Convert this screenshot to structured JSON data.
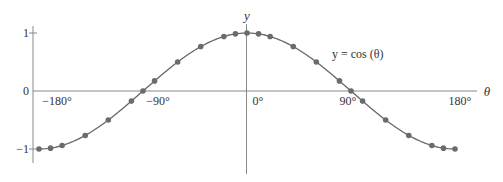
{
  "chart_data": {
    "type": "line",
    "title": "",
    "function_label": "y = cos (θ)",
    "xlabel": "θ",
    "ylabel": "y",
    "xlim": [
      -180,
      180
    ],
    "ylim": [
      -1,
      1
    ],
    "grid": false,
    "legend": null,
    "x_ticks": [
      {
        "value": -180,
        "label": "−180°"
      },
      {
        "value": -90,
        "label": "−90°"
      },
      {
        "value": 0,
        "label": "0°"
      },
      {
        "value": 90,
        "label": "90°"
      },
      {
        "value": 180,
        "label": "180°"
      }
    ],
    "y_ticks": [
      {
        "value": 1,
        "label": "1"
      },
      {
        "value": 0,
        "label": "0"
      },
      {
        "value": -1,
        "label": "−1"
      }
    ],
    "series": [
      {
        "name": "y = cos (θ)",
        "color": "#666666",
        "marker_color": "#6b6b6b",
        "x": [
          -180,
          -170,
          -160,
          -140,
          -120,
          -100,
          -90,
          -80,
          -60,
          -40,
          -20,
          -10,
          0,
          10,
          20,
          40,
          60,
          80,
          90,
          100,
          120,
          140,
          160,
          170,
          180
        ],
        "y": [
          -1,
          -0.985,
          -0.94,
          -0.766,
          -0.5,
          -0.174,
          0,
          0.174,
          0.5,
          0.766,
          0.94,
          0.985,
          1,
          0.985,
          0.94,
          0.766,
          0.5,
          0.174,
          0,
          -0.174,
          -0.5,
          -0.766,
          -0.94,
          -0.985,
          -1
        ]
      }
    ]
  },
  "layout": {
    "origin_x": 247,
    "origin_y": 91,
    "px_per_degree": 1.1556,
    "px_per_unit_y": 58,
    "left_axis_x": 33,
    "axis_color": "#888888",
    "curve_color": "#666666"
  }
}
